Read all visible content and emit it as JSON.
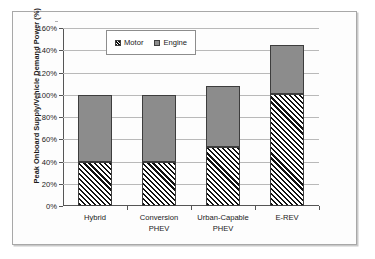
{
  "chart_data": {
    "type": "bar",
    "stacked": true,
    "title": "",
    "xlabel": "",
    "ylabel": "Peak Onboard Supply/Vehicle Demand Power (%)",
    "categories": [
      "Hybrid",
      "Conversion PHEV",
      "Urban-Capable PHEV",
      "E-REV"
    ],
    "category_lines": [
      [
        "Hybrid"
      ],
      [
        "Conversion",
        "PHEV"
      ],
      [
        "Urban-Capable",
        "PHEV"
      ],
      [
        "E-REV"
      ]
    ],
    "series": [
      {
        "name": "Motor",
        "values": [
          40,
          40,
          53,
          101
        ]
      },
      {
        "name": "Engine",
        "values": [
          60,
          60,
          55,
          44
        ]
      }
    ],
    "totals": [
      100,
      100,
      108,
      145
    ],
    "ylim": [
      0,
      160
    ],
    "ytick_values": [
      0,
      20,
      40,
      60,
      80,
      100,
      120,
      140,
      160
    ],
    "ytick_labels": [
      "0%",
      "20%",
      "40%",
      "60%",
      "80%",
      "100%",
      "120%",
      "140%",
      "160%"
    ],
    "grid": true,
    "legend_position": "top-center",
    "colors": {
      "engine": "#8c8c8c",
      "motor_hatch": "#111111",
      "motor_background": "#ffffff",
      "bar_outline": "#3d3d3d",
      "gridline": "#b9b9b9",
      "axis": "#555555",
      "frame": "#a8a8a8"
    }
  },
  "legend": {
    "entries": [
      {
        "label": "Motor",
        "swatch": "hatched"
      },
      {
        "label": "Engine",
        "swatch": "gray"
      }
    ]
  }
}
